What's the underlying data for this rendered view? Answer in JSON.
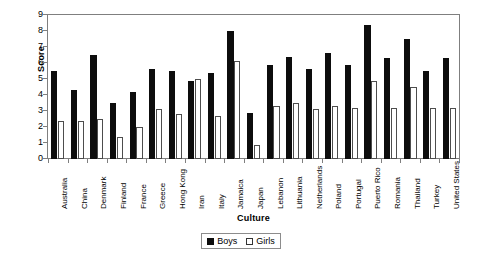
{
  "chart_data": {
    "type": "bar",
    "title": "",
    "xlabel": "Culture",
    "ylabel": "Score",
    "ylim": [
      0,
      9
    ],
    "yticks": [
      0,
      1,
      2,
      3,
      4,
      5,
      6,
      7,
      8,
      9
    ],
    "grid": false,
    "legend_position": "bottom-center",
    "categories": [
      "Australia",
      "China",
      "Denmark",
      "Finland",
      "France",
      "Greece",
      "Hong Kong",
      "Iran",
      "Italy",
      "Jamaica",
      "Japan",
      "Lebanon",
      "Lithuania",
      "Netherlands",
      "Poland",
      "Portugal",
      "Puerto Rico",
      "Romania",
      "Thailand",
      "Turkey",
      "United States"
    ],
    "series": [
      {
        "name": "Boys",
        "color": "#0d0d0d",
        "values": [
          5.5,
          4.3,
          6.5,
          3.5,
          4.2,
          5.6,
          5.5,
          4.9,
          5.4,
          8.0,
          2.9,
          5.9,
          6.4,
          5.6,
          6.6,
          5.9,
          8.4,
          6.3,
          7.5,
          5.5,
          6.3
        ]
      },
      {
        "name": "Girls",
        "color": "#ffffff",
        "values": [
          2.4,
          2.4,
          2.5,
          1.4,
          2.0,
          3.1,
          2.8,
          5.0,
          2.7,
          6.1,
          0.9,
          3.3,
          3.5,
          3.1,
          3.3,
          3.2,
          4.9,
          3.2,
          4.5,
          3.2,
          3.2
        ]
      }
    ]
  },
  "legend": {
    "items": [
      {
        "label": "Boys"
      },
      {
        "label": "Girls"
      }
    ]
  }
}
